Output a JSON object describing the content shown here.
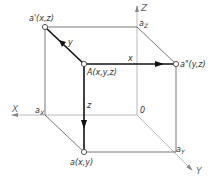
{
  "diagram": {
    "type": "orthographic-projection-cube",
    "axes": {
      "x": "X",
      "y": "Y",
      "z": "Z",
      "origin": "0"
    },
    "axis_points": {
      "ax": {
        "main": "a",
        "sub": "X"
      },
      "ay": {
        "main": "a",
        "sub": "Y"
      },
      "az": {
        "main": "a",
        "sub": "Z"
      }
    },
    "points": {
      "A": "A(x,y,z)",
      "a": "a(x,y)",
      "a_prime": "a'(x,z)",
      "a_double_prime": "a\"(y,z)"
    },
    "vector_labels": {
      "x": "x",
      "y": "y",
      "z": "z"
    },
    "colors": {
      "heavy_line": "#111111",
      "thin_line": "#555555",
      "axis_line": "#aaaaaa",
      "text": "#333333"
    }
  }
}
